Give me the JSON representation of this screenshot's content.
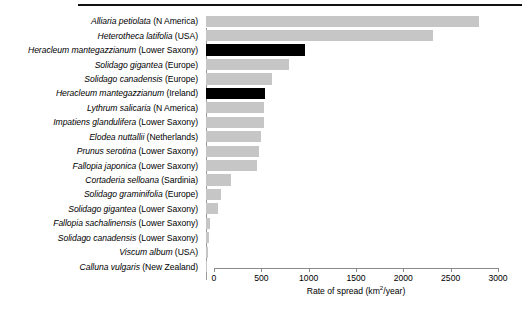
{
  "chart_data": {
    "type": "bar",
    "orientation": "horizontal",
    "title": "",
    "xlabel": "Rate of spread (km2/year)",
    "xlabel_base": "Rate of spread (km",
    "xlabel_sup": "2",
    "xlabel_tail": "/year)",
    "ylabel": "",
    "xlim": [
      0,
      3000
    ],
    "xticks": [
      0,
      500,
      1000,
      1500,
      2000,
      2500,
      3000
    ],
    "xticklabels": [
      "0",
      "500",
      "1000",
      "1500",
      "2000",
      "2500",
      "3000"
    ],
    "grid": false,
    "legend": "none",
    "colors": {
      "bar_default": "#c6c6c6",
      "bar_highlight": "#000000",
      "axis": "#8a8a8a",
      "rule": "#111111"
    },
    "categories": [
      "Alliaria petiolata (N America)",
      "Heterotheca latifolia (USA)",
      "Heracleum mantegazzianum (Lower Saxony)",
      "Solidago gigantea (Europe)",
      "Solidago canadensis (Europe)",
      "Heracleum mantegazzianum (Ireland)",
      "Lythrum salicaria (N America)",
      "Impatiens glandulifera (Lower Saxony)",
      "Elodea nuttallii (Netherlands)",
      "Prunus serotina (Lower Saxony)",
      "Fallopia japonica (Lower Saxony)",
      "Cortaderia selloana (Sardinia)",
      "Solidago graminifolia (Europe)",
      "Solidago gigantea (Lower Saxony)",
      "Fallopia sachalinensis (Lower Saxony)",
      "Solidago canadensis (Lower Saxony)",
      "Viscum album (USA)",
      "Calluna vulgaris (New Zealand)"
    ],
    "values": [
      2880,
      2400,
      1050,
      880,
      700,
      620,
      615,
      610,
      580,
      555,
      540,
      260,
      160,
      130,
      40,
      28,
      20,
      5
    ],
    "highlighted": [
      "Heracleum mantegazzianum (Lower Saxony)",
      "Heracleum mantegazzianum (Ireland)"
    ],
    "rows": [
      {
        "species": "Alliaria petiolata",
        "region": "(N America)",
        "value": 2880,
        "highlight": false
      },
      {
        "species": "Heterotheca latifolia",
        "region": "(USA)",
        "value": 2400,
        "highlight": false
      },
      {
        "species": "Heracleum mantegazzianum",
        "region": "(Lower Saxony)",
        "value": 1050,
        "highlight": true
      },
      {
        "species": "Solidago gigantea",
        "region": "(Europe)",
        "value": 880,
        "highlight": false
      },
      {
        "species": "Solidago canadensis",
        "region": "(Europe)",
        "value": 700,
        "highlight": false
      },
      {
        "species": "Heracleum mantegazzianum",
        "region": "(Ireland)",
        "value": 620,
        "highlight": true
      },
      {
        "species": "Lythrum salicaria",
        "region": "(N America)",
        "value": 615,
        "highlight": false
      },
      {
        "species": "Impatiens glandulifera",
        "region": "(Lower Saxony)",
        "value": 610,
        "highlight": false
      },
      {
        "species": "Elodea nuttallii",
        "region": "(Netherlands)",
        "value": 580,
        "highlight": false
      },
      {
        "species": "Prunus serotina",
        "region": "(Lower Saxony)",
        "value": 555,
        "highlight": false
      },
      {
        "species": "Fallopia japonica",
        "region": "(Lower Saxony)",
        "value": 540,
        "highlight": false
      },
      {
        "species": "Cortaderia selloana",
        "region": "(Sardinia)",
        "value": 260,
        "highlight": false
      },
      {
        "species": "Solidago graminifolia",
        "region": "(Europe)",
        "value": 160,
        "highlight": false
      },
      {
        "species": "Solidago gigantea",
        "region": "(Lower Saxony)",
        "value": 130,
        "highlight": false
      },
      {
        "species": "Fallopia sachalinensis",
        "region": "(Lower Saxony)",
        "value": 40,
        "highlight": false
      },
      {
        "species": "Solidago canadensis",
        "region": "(Lower Saxony)",
        "value": 28,
        "highlight": false
      },
      {
        "species": "Viscum album",
        "region": "(USA)",
        "value": 20,
        "highlight": false
      },
      {
        "species": "Calluna vulgaris",
        "region": "(New Zealand)",
        "value": 5,
        "highlight": false
      }
    ]
  }
}
